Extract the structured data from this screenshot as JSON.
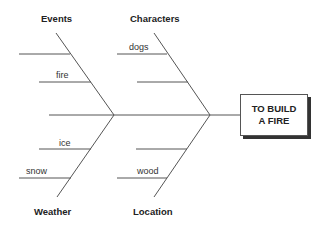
{
  "diagram": {
    "type": "fishbone",
    "effect": {
      "line1": "TO BUILD",
      "line2": "A FIRE"
    },
    "categories": [
      {
        "name": "Events",
        "position": "top-left",
        "causes": [
          "",
          "fire"
        ]
      },
      {
        "name": "Characters",
        "position": "top-right",
        "causes": [
          "dogs",
          ""
        ]
      },
      {
        "name": "Weather",
        "position": "bottom-left",
        "causes": [
          "ice",
          "snow"
        ]
      },
      {
        "name": "Location",
        "position": "bottom-right",
        "causes": [
          "",
          "wood"
        ]
      }
    ],
    "colors": {
      "line": "#555555",
      "text": "#222222",
      "shadow": "#333333"
    }
  }
}
